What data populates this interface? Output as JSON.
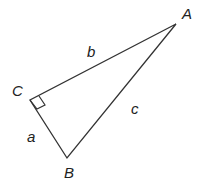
{
  "diagram": {
    "type": "right-triangle",
    "vertices": {
      "A": {
        "label": "A",
        "x": 176,
        "y": 24
      },
      "B": {
        "label": "B",
        "x": 67,
        "y": 158
      },
      "C": {
        "label": "C",
        "x": 30,
        "y": 100
      }
    },
    "sides": {
      "a": {
        "label": "a"
      },
      "b": {
        "label": "b"
      },
      "c": {
        "label": "c"
      }
    },
    "right_angle_at": "C",
    "line_color": "#333333"
  }
}
